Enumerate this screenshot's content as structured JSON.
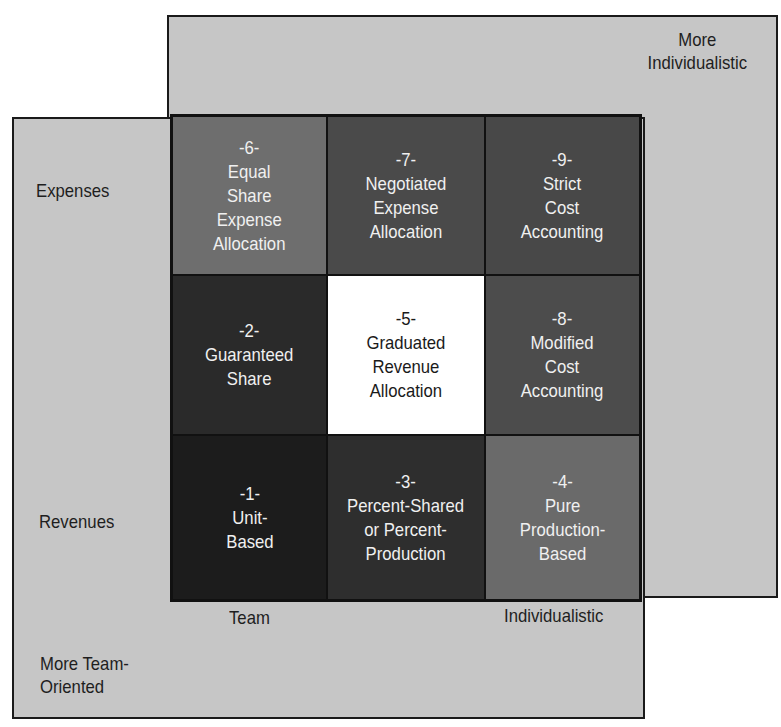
{
  "diagram": {
    "title": "",
    "axes": {
      "top_right_corner_label": [
        "More",
        "Individualistic"
      ],
      "bottom_left_corner_label": [
        "More Team-",
        "Oriented"
      ],
      "row_labels": {
        "top": "Expenses",
        "bottom": "Revenues"
      },
      "column_labels": {
        "left": "Team",
        "right": "Individualistic"
      }
    },
    "colors": {
      "background_rect": "#c6c6c6",
      "border": "#1a1a1a",
      "cells": {
        "1": "#1c1c1c",
        "2": "#2a2a2a",
        "3": "#2e2e2e",
        "4": "#6a6a6a",
        "5": "#ffffff",
        "6": "#6e6e6e",
        "7": "#4a4a4a",
        "8": "#4c4c4c",
        "9": "#484848"
      }
    },
    "grid": [
      [
        {
          "number": "-6-",
          "lines": [
            "Equal",
            "Share",
            "Expense",
            "Allocation"
          ]
        },
        {
          "number": "-7-",
          "lines": [
            "Negotiated",
            "Expense",
            "Allocation"
          ]
        },
        {
          "number": "-9-",
          "lines": [
            "Strict",
            "Cost",
            "Accounting"
          ]
        }
      ],
      [
        {
          "number": "-2-",
          "lines": [
            "Guaranteed",
            "Share"
          ]
        },
        {
          "number": "-5-",
          "lines": [
            "Graduated",
            "Revenue",
            "Allocation"
          ]
        },
        {
          "number": "-8-",
          "lines": [
            "Modified",
            "Cost",
            "Accounting"
          ]
        }
      ],
      [
        {
          "number": "-1-",
          "lines": [
            "Unit-",
            "Based"
          ]
        },
        {
          "number": "-3-",
          "lines": [
            "Percent-Shared",
            "or Percent-",
            "Production"
          ]
        },
        {
          "number": "-4-",
          "lines": [
            "Pure",
            "Production-",
            "Based"
          ]
        }
      ]
    ]
  }
}
